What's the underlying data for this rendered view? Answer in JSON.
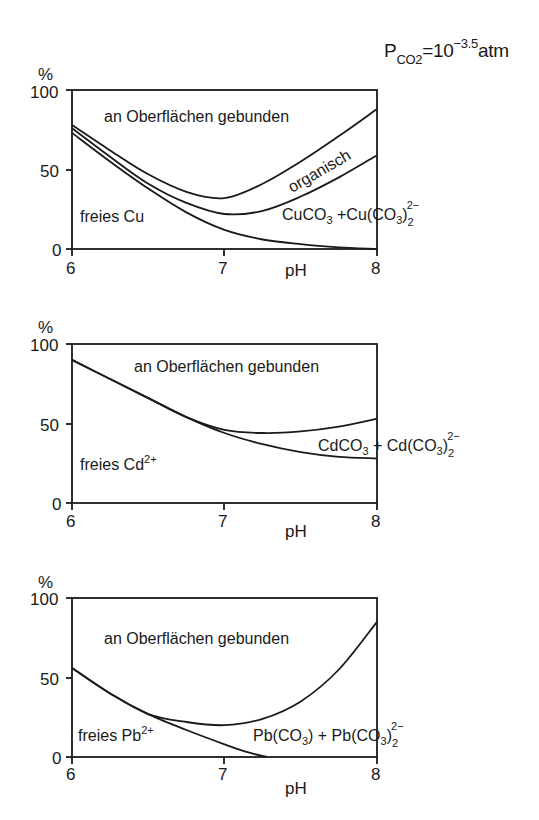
{
  "header": {
    "pco2_label_p": "P",
    "pco2_label_sub": "CO2",
    "pco2_equals": "=10",
    "pco2_exponent": "−3.5",
    "pco2_unit": "atm"
  },
  "chart_data": [
    {
      "type": "area",
      "title": "Cu speciation",
      "xlabel": "pH",
      "ylabel": "%",
      "xlim": [
        6,
        8
      ],
      "ylim": [
        0,
        100
      ],
      "xticks": [
        "6",
        "7",
        "8"
      ],
      "yticks": [
        "0",
        "50",
        "100"
      ],
      "series": [
        {
          "name": "freies Cu (upper boundary)",
          "x": [
            6.0,
            6.25,
            6.5,
            6.75,
            7.0,
            7.25,
            7.5,
            7.75,
            8.0
          ],
          "values": [
            73,
            55,
            38,
            23,
            12,
            6,
            3,
            1,
            0
          ]
        },
        {
          "name": "CuCO3 + Cu(CO3)2 2- (upper boundary)",
          "x": [
            6.0,
            6.25,
            6.5,
            6.75,
            7.0,
            7.25,
            7.5,
            7.75,
            8.0
          ],
          "values": [
            76,
            58,
            41,
            29,
            22,
            24,
            33,
            45,
            59
          ]
        },
        {
          "name": "organisch (upper boundary)",
          "x": [
            6.0,
            6.25,
            6.5,
            6.75,
            7.0,
            7.25,
            7.5,
            7.75,
            8.0
          ],
          "values": [
            78,
            62,
            47,
            36,
            32,
            41,
            55,
            71,
            88
          ]
        }
      ],
      "regions": [
        "an Oberflächen gebunden",
        "organisch",
        "CuCO3 + Cu(CO3)2 2-",
        "freies Cu"
      ]
    },
    {
      "type": "area",
      "title": "Cd speciation",
      "xlabel": "pH",
      "ylabel": "%",
      "xlim": [
        6,
        8
      ],
      "ylim": [
        0,
        100
      ],
      "xticks": [
        "6",
        "7",
        "8"
      ],
      "yticks": [
        "0",
        "50",
        "100"
      ],
      "series": [
        {
          "name": "freies Cd2+ (upper boundary)",
          "x": [
            6.0,
            6.25,
            6.5,
            6.75,
            7.0,
            7.25,
            7.5,
            7.75,
            8.0
          ],
          "values": [
            90,
            78,
            66,
            54,
            44,
            37,
            32,
            29,
            28
          ]
        },
        {
          "name": "CdCO3 + Cd(CO3)2 2- (upper boundary)",
          "x": [
            6.0,
            6.25,
            6.5,
            6.75,
            7.0,
            7.25,
            7.5,
            7.75,
            8.0
          ],
          "values": [
            90,
            78,
            66,
            54,
            46,
            44,
            45,
            48,
            53
          ]
        }
      ],
      "regions": [
        "an Oberflächen gebunden",
        "CdCO3 + Cd(CO3)2 2-",
        "freies Cd2+"
      ]
    },
    {
      "type": "area",
      "title": "Pb speciation",
      "xlabel": "pH",
      "ylabel": "%",
      "xlim": [
        6,
        8
      ],
      "ylim": [
        0,
        100
      ],
      "xticks": [
        "6",
        "7",
        "8"
      ],
      "yticks": [
        "0",
        "50",
        "100"
      ],
      "series": [
        {
          "name": "freies Pb2+ (upper boundary)",
          "x": [
            6.0,
            6.25,
            6.5,
            6.75,
            7.0,
            7.15,
            7.28
          ],
          "values": [
            56,
            40,
            27,
            17,
            8,
            3,
            0
          ]
        },
        {
          "name": "Pb(CO3) + Pb(CO3)2 2- (upper boundary)",
          "x": [
            6.0,
            6.25,
            6.5,
            6.75,
            7.0,
            7.25,
            7.5,
            7.75,
            8.0
          ],
          "values": [
            56,
            40,
            27,
            22,
            20,
            24,
            35,
            55,
            85
          ]
        }
      ],
      "regions": [
        "an Oberflächen gebunden",
        "Pb(CO3) + Pb(CO3)2 2-",
        "freies Pb2+"
      ]
    }
  ],
  "labels": {
    "percent": "%",
    "ph": "pH",
    "surface_bound": "an Oberflächen gebunden",
    "organic": "organisch",
    "free_cu": "freies Cu",
    "cu_carb_a": "CuCO",
    "cu_carb_b": "3",
    "cu_carb_c": " +Cu(CO",
    "cu_carb_d": "3",
    "cu_carb_e": ")",
    "cu_carb_f": "2",
    "cu_carb_g": "2−",
    "free_cd_a": "freies Cd",
    "free_cd_sup": "2+",
    "cd_carb_a": "CdCO",
    "cd_carb_b": "3",
    "cd_carb_c": " + Cd(CO",
    "cd_carb_d": "3",
    "cd_carb_e": ")",
    "cd_carb_f": "2",
    "cd_carb_g": "2−",
    "free_pb_a": "freies Pb",
    "free_pb_sup": "2+",
    "pb_carb_a": "Pb(CO",
    "pb_carb_b": "3",
    "pb_carb_c": ") + Pb(CO",
    "pb_carb_d": "3",
    "pb_carb_e": ")",
    "pb_carb_f": "2",
    "pb_carb_g": "2−"
  }
}
